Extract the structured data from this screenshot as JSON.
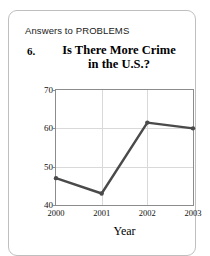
{
  "card": {
    "header_label": "Answers to PROBLEMS",
    "problem_number": "6.",
    "title_line1": "Is There More Crime",
    "title_line2": "in the U.S.?"
  },
  "chart_data": {
    "type": "line",
    "title": "Is There More Crime in the U.S.?",
    "xlabel": "Year",
    "ylabel": "",
    "categories": [
      "2000",
      "2001",
      "2002",
      "2003"
    ],
    "x": [
      2000,
      2001,
      2002,
      2003
    ],
    "values": [
      47,
      43,
      61.5,
      60
    ],
    "series": [
      {
        "name": "Percent who say there is more crime",
        "values": [
          47,
          43,
          61.5,
          60
        ]
      }
    ],
    "ylim": [
      40,
      70
    ],
    "xlim": [
      2000,
      2003
    ],
    "yticks": [
      40,
      50,
      60,
      70
    ],
    "ytick_labels": [
      "40",
      "50",
      "60",
      "70"
    ],
    "xticks": [
      2000,
      2001,
      2002,
      2003
    ],
    "xtick_labels": [
      "2000",
      "2001",
      "2002",
      "2003"
    ],
    "grid": true,
    "legend": false,
    "line_color": "#4a4a4a",
    "marker": "circle",
    "frame_color": "#8c8c8c",
    "grid_color": "#d9d9d9"
  }
}
